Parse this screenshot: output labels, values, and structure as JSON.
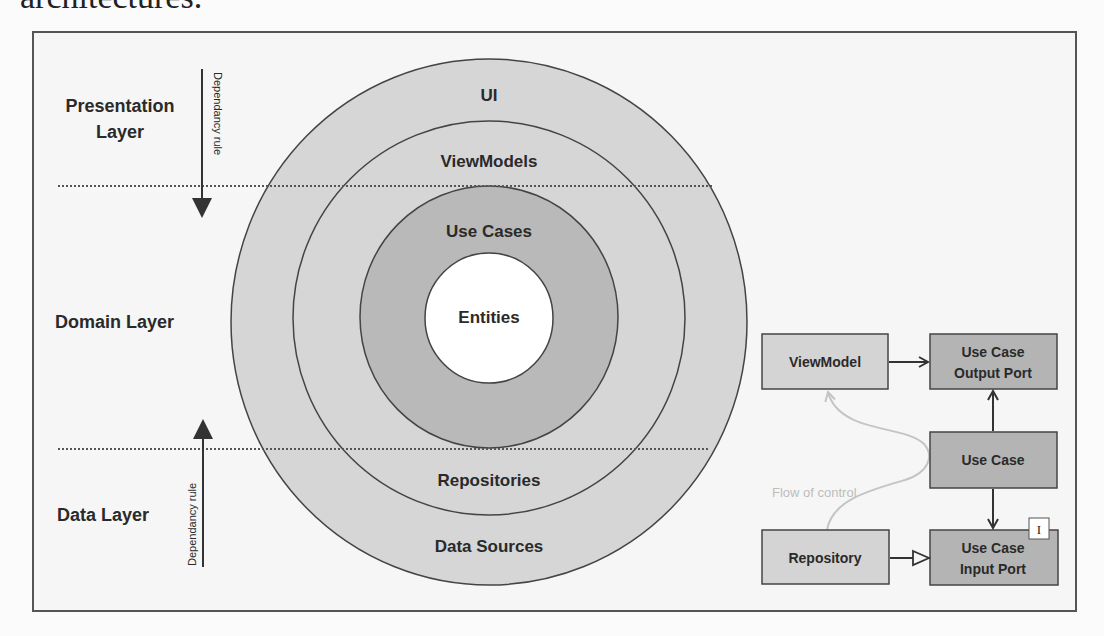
{
  "caption": "architectures.",
  "layers": {
    "presentation": [
      "Presentation",
      "Layer"
    ],
    "domain": "Domain Layer",
    "data": "Data Layer"
  },
  "dependency_rule": "Dependancy rule",
  "rings": {
    "ui": "UI",
    "viewmodels": "ViewModels",
    "use_cases": "Use Cases",
    "entities": "Entities",
    "repositories": "Repositories",
    "data_sources": "Data Sources"
  },
  "flow": {
    "viewmodel": "ViewModel",
    "output_port": [
      "Use Case",
      "Output Port"
    ],
    "use_case": "Use Case",
    "repository": "Repository",
    "input_port": [
      "Use Case",
      "Input Port"
    ],
    "interface_badge": "I",
    "flow_of_control": "Flow of control"
  },
  "colors": {
    "outer_ring": "#d6d6d6",
    "use_cases_ring": "#b9b9b9",
    "entities_core": "#ffffff",
    "light_box": "#d4d4d4",
    "dark_box": "#b4b4b4",
    "flow_line": "#bdbdbd"
  }
}
